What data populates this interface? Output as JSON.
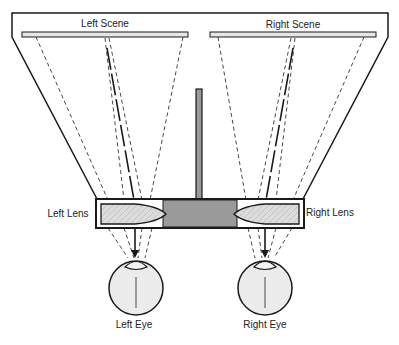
{
  "diagram": {
    "labels": {
      "left_scene": "Left Scene",
      "right_scene": "Right Scene",
      "left_lens": "Left Lens",
      "right_lens": "Right Lens",
      "left_eye": "Left Eye",
      "right_eye": "Right Eye"
    },
    "colors": {
      "outline": "#1a1a1a",
      "scene_fill": "#e6e6e6",
      "divider_fill": "#9a9a9a",
      "lens_fill": "#d9d9d9",
      "eye_fill": "#ececec",
      "ray": "#333333"
    },
    "components": [
      {
        "id": "housing",
        "type": "trapezoid-frame"
      },
      {
        "id": "left-scene",
        "type": "image-plane"
      },
      {
        "id": "right-scene",
        "type": "image-plane"
      },
      {
        "id": "center-divider",
        "type": "septum"
      },
      {
        "id": "lens-box",
        "type": "lens-holder"
      },
      {
        "id": "left-lens",
        "type": "prism-lens"
      },
      {
        "id": "right-lens",
        "type": "prism-lens"
      },
      {
        "id": "left-eye",
        "type": "eye"
      },
      {
        "id": "right-eye",
        "type": "eye"
      }
    ]
  }
}
